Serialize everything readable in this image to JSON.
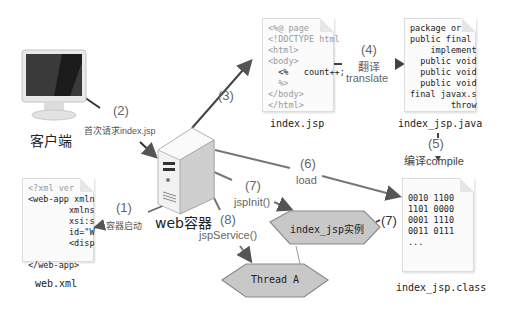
{
  "diagram": {
    "client": {
      "label": "客户端",
      "icon": "monitor-icon"
    },
    "server": {
      "label": "web容器",
      "icon": "server-tower-icon"
    },
    "web_xml": {
      "caption": "web.xml",
      "lines": [
        "<?xml ver",
        "<web-app xmln",
        "        xmlns",
        "        xsi:s",
        "        id=\"W",
        "        <disp",
        "",
        "</web-app>"
      ]
    },
    "index_jsp": {
      "caption": "index.jsp",
      "lines": [
        "<%@ page",
        "<!DOCTYPE html",
        "<html>",
        "<body>",
        "  <%   count++;",
        "  %>",
        "</body>",
        "</html>"
      ]
    },
    "index_jsp_java": {
      "caption": "index_jsp.java",
      "lines": [
        "package or",
        "public final",
        "    implement",
        "  public void",
        "  public void",
        "  public void",
        "final javax.s",
        "        throw"
      ]
    },
    "index_jsp_class": {
      "caption": "index_jsp.class",
      "lines": [
        "0010 1100",
        "1101 0000",
        "0001 1110",
        "0011 0111",
        "..."
      ]
    },
    "instance": {
      "label": "index_jsp实例"
    },
    "thread": {
      "label": "Thread A"
    },
    "steps": {
      "s1": {
        "num": "(1)",
        "text": "容器启动"
      },
      "s2": {
        "num": "(2)",
        "text": "首次请求index.jsp"
      },
      "s3": {
        "num": "(3)"
      },
      "s4": {
        "num": "(4)",
        "text_cn": "翻译",
        "text_en": "translate"
      },
      "s5": {
        "num": "(5)",
        "text": "编译compile"
      },
      "s6": {
        "num": "(6)",
        "text": "load"
      },
      "s7": {
        "num": "(7)",
        "text": "jspInit()"
      },
      "s7b": {
        "num": "(7)"
      },
      "s8": {
        "num": "(8)",
        "text": "jspService()"
      }
    },
    "colors": {
      "line": "#777777",
      "arrow": "#555555",
      "hex_fill": "#c8c8c8",
      "hex_stroke": "#8a8a8a",
      "label": "#666666"
    }
  }
}
